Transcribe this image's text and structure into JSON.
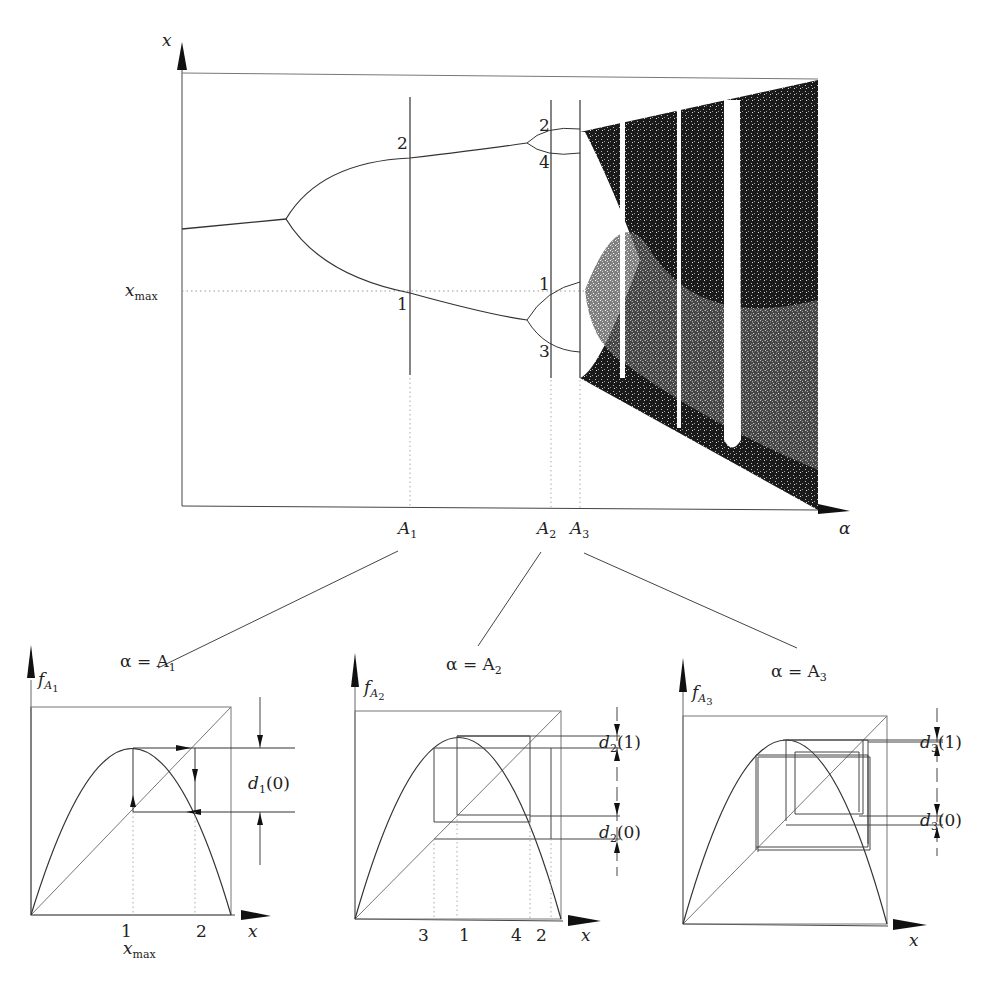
{
  "bifurcation": {
    "y_axis_label": "x",
    "x_axis_label": "α",
    "x_max_label": "x",
    "x_max_sub": "max",
    "markers": [
      {
        "name": "A",
        "sub": "1"
      },
      {
        "name": "A",
        "sub": "2"
      },
      {
        "name": "A",
        "sub": "3"
      }
    ],
    "branch_labels": {
      "a1_upper": "2",
      "a1_lower": "1",
      "a2_top": "2",
      "a2_second": "4",
      "a2_third": "1",
      "a2_bottom": "3"
    }
  },
  "panels": [
    {
      "title_prefix": "α = A",
      "title_sub": "1",
      "y_label": "f",
      "y_label_sub": "A",
      "y_label_subsub": "1",
      "x_label": "x",
      "ticks": [
        "1",
        "2"
      ],
      "x_max_label": "x",
      "x_max_sub": "max",
      "distances": [
        {
          "prefix": "d",
          "sub": "1",
          "arg": "(0)"
        }
      ]
    },
    {
      "title_prefix": "α = A",
      "title_sub": "2",
      "y_label": "f",
      "y_label_sub": "A",
      "y_label_subsub": "2",
      "x_label": "x",
      "ticks": [
        "3",
        "1",
        "4",
        "2"
      ],
      "distances": [
        {
          "prefix": "d",
          "sub": "2",
          "arg": "(1)"
        },
        {
          "prefix": "d",
          "sub": "2",
          "arg": "(0)"
        }
      ]
    },
    {
      "title_prefix": "α = A",
      "title_sub": "3",
      "y_label": "f",
      "y_label_sub": "A",
      "y_label_subsub": "3",
      "x_label": "x",
      "ticks": [],
      "distances": [
        {
          "prefix": "d",
          "sub": "3",
          "arg": "(1)"
        },
        {
          "prefix": "d",
          "sub": "3",
          "arg": "(0)"
        }
      ]
    }
  ],
  "colors": {
    "ink": "#222222",
    "grid": "#888888",
    "background": "#ffffff"
  }
}
